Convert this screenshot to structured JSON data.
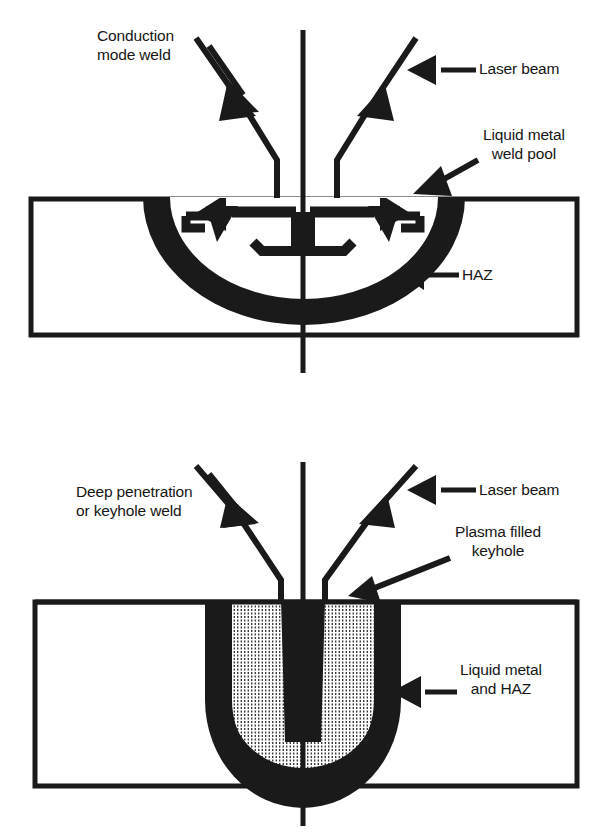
{
  "figure": {
    "background_color": "#ffffff",
    "ink_color": "#1a1a1a"
  },
  "panels": [
    {
      "id": "conduction-mode",
      "name": "Conduction mode weld panel",
      "labels": {
        "process": "Conduction\nmode weld",
        "laser_beam": "Laser beam",
        "weld_pool": "Liquid metal\nweld pool",
        "haz": "HAZ"
      },
      "features": [
        "workpiece cross-section rectangle",
        "vertical centerline",
        "two converging laser beams with arrowheads",
        "shallow semicircular fusion zone",
        "circulating melt-flow arrows inside the pool",
        "heat affected zone band"
      ]
    },
    {
      "id": "keyhole-mode",
      "name": "Deep penetration keyhole weld panel",
      "labels": {
        "process": "Deep penetration\nor keyhole weld",
        "laser_beam": "Laser beam",
        "keyhole": "Plasma filled\nkeyhole",
        "liquid_metal_haz": "Liquid metal\nand HAZ"
      },
      "features": [
        "workpiece cross-section rectangle",
        "vertical centerline",
        "two converging laser beams with arrowheads",
        "deep narrow U-shaped fusion zone",
        "cross-hatched molten pool band",
        "solid dark plasma filled keyhole at centre"
      ]
    }
  ],
  "labels": {
    "conduction_mode_weld_line1": "Conduction",
    "conduction_mode_weld_line2": "mode weld",
    "laser_beam_top": "Laser beam",
    "liquid_metal_weld_pool_line1": "Liquid metal",
    "liquid_metal_weld_pool_line2": "weld pool",
    "haz_top": "HAZ",
    "deep_penetration_line1": "Deep penetration",
    "deep_penetration_line2": "or keyhole weld",
    "laser_beam_bottom": "Laser beam",
    "plasma_filled_keyhole_line1": "Plasma filled",
    "plasma_filled_keyhole_line2": "keyhole",
    "liquid_metal_and_haz_line1": "Liquid metal",
    "liquid_metal_and_haz_line2": "and HAZ"
  }
}
